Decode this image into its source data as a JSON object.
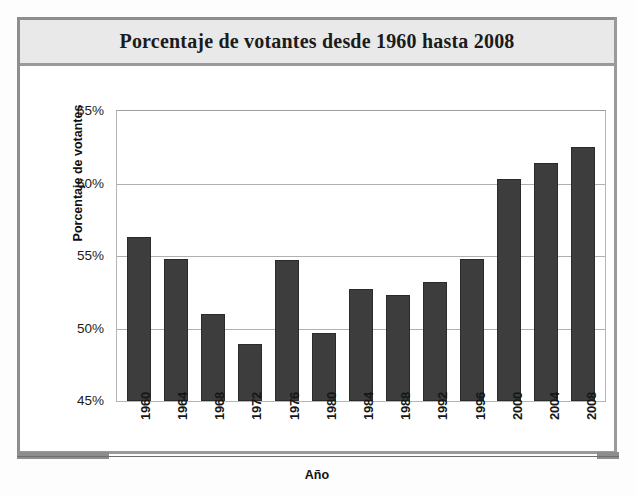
{
  "chart_data": {
    "type": "bar",
    "title": "Porcentaje de votantes desde 1960 hasta 2008",
    "xlabel": "Año",
    "ylabel": "Porcentaje de votantes",
    "categories": [
      "1960",
      "1964",
      "1968",
      "1972",
      "1976",
      "1980",
      "1984",
      "1988",
      "1992",
      "1996",
      "2000",
      "2004",
      "2008"
    ],
    "values": [
      56.3,
      54.8,
      51.0,
      48.9,
      54.7,
      49.7,
      52.7,
      52.3,
      53.2,
      54.8,
      60.3,
      61.4,
      62.5
    ],
    "ylim": [
      45,
      65
    ],
    "ytick_labels": [
      "65%",
      "60%",
      "55%",
      "50%",
      "45%"
    ],
    "ytick_values": [
      65,
      60,
      55,
      50,
      45
    ],
    "grid": true,
    "legend": null,
    "bar_color": "#3d3d3d",
    "grid_color": "#b0b0b0",
    "frame_color": "#9a9a9a",
    "title_band_color": "#e9e9e9"
  }
}
